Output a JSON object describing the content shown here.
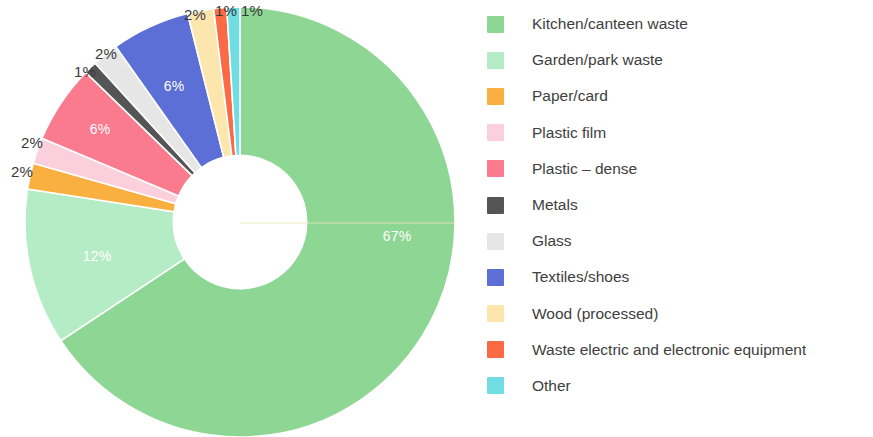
{
  "chart_data": {
    "type": "pie",
    "variant": "donut",
    "title": "",
    "subtitle": "",
    "xlabel": "",
    "ylabel": "",
    "unit": "%",
    "start_angle_deg": 0,
    "direction": "clockwise",
    "inner_radius_ratio": 0.31,
    "legend_position": "right",
    "grid": false,
    "categories": [
      "Kitchen/canteen waste",
      "Garden/park waste",
      "Paper/card",
      "Plastic film",
      "Plastic – dense",
      "Metals",
      "Glass",
      "Textiles/shoes",
      "Wood (processed)",
      "Waste electric and electronic equipment",
      "Other"
    ],
    "values": [
      67,
      12,
      2,
      2,
      6,
      1,
      2,
      6,
      2,
      1,
      1
    ],
    "labels": [
      "67%",
      "12%",
      "2%",
      "2%",
      "6%",
      "1%",
      "2%",
      "6%",
      "2%",
      "1%",
      "1%"
    ],
    "colors": [
      "#8ed694",
      "#b4ecc6",
      "#fab040",
      "#fbd0dc",
      "#fa7a8e",
      "#555555",
      "#e6e6e6",
      "#5b6fd6",
      "#fde5ae",
      "#fa6b45",
      "#6fdde2"
    ]
  },
  "legend": {
    "items": [
      {
        "label": "Kitchen/canteen waste",
        "color": "#8ed694"
      },
      {
        "label": "Garden/park waste",
        "color": "#b4ecc6"
      },
      {
        "label": "Paper/card",
        "color": "#fab040"
      },
      {
        "label": "Plastic film",
        "color": "#fbd0dc"
      },
      {
        "label": "Plastic – dense",
        "color": "#fa7a8e"
      },
      {
        "label": "Metals",
        "color": "#555555"
      },
      {
        "label": "Glass",
        "color": "#e6e6e6"
      },
      {
        "label": "Textiles/shoes",
        "color": "#5b6fd6"
      },
      {
        "label": "Wood (processed)",
        "color": "#fde5ae"
      },
      {
        "label": "Waste electric and electronic equipment",
        "color": "#fa6b45"
      },
      {
        "label": "Other",
        "color": "#6fdde2"
      }
    ]
  },
  "slice_labels": [
    {
      "text": "67%",
      "x": 397,
      "y": 236,
      "placement": "inside"
    },
    {
      "text": "12%",
      "x": 97,
      "y": 256,
      "placement": "inside"
    },
    {
      "text": "2%",
      "x": 22,
      "y": 171,
      "placement": "outside"
    },
    {
      "text": "2%",
      "x": 32,
      "y": 142,
      "placement": "outside"
    },
    {
      "text": "6%",
      "x": 100,
      "y": 129,
      "placement": "inside"
    },
    {
      "text": "1%",
      "x": 85,
      "y": 71,
      "placement": "outside"
    },
    {
      "text": "2%",
      "x": 106,
      "y": 53,
      "placement": "outside"
    },
    {
      "text": "6%",
      "x": 174,
      "y": 86,
      "placement": "inside"
    },
    {
      "text": "2%",
      "x": 195,
      "y": 14,
      "placement": "outside"
    },
    {
      "text": "1%",
      "x": 226,
      "y": 10,
      "placement": "outside"
    },
    {
      "text": "1%",
      "x": 252,
      "y": 10,
      "placement": "outside"
    }
  ]
}
